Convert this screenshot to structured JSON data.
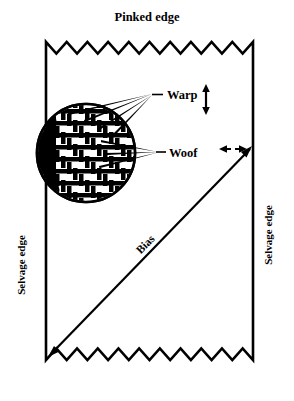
{
  "figure": {
    "background_color": "#ffffff",
    "ink_color": "#000000"
  },
  "labels": {
    "pinked_edge": "Pinked edge",
    "warp": "Warp",
    "woof": "Woof",
    "bias": "Bias",
    "selvage_edge_left": "Selvage edge",
    "selvage_edge_right": "Selvage edge"
  },
  "annotations": {
    "warp_arrow": "vertical-double-arrow",
    "woof_arrow": "horizontal-dashed-double-arrow",
    "bias_arrow": "diagonal-arrow",
    "magnifier": "weave-detail-circle"
  },
  "icons": {
    "warp_direction_icon": "arrow-up-down-icon",
    "woof_direction_icon": "arrow-left-right-dashed-icon",
    "bias_direction_icon": "arrow-diagonal-icon",
    "weave_circle_icon": "magnified-weave-icon"
  },
  "geometry": {
    "fabric_left": 46,
    "fabric_right": 253,
    "fabric_top": 42,
    "fabric_bottom": 360,
    "pinked_teeth_top": 10,
    "pinked_teeth_bottom": 10,
    "circle_center_x": 86,
    "circle_center_y": 153,
    "circle_radius": 50
  }
}
